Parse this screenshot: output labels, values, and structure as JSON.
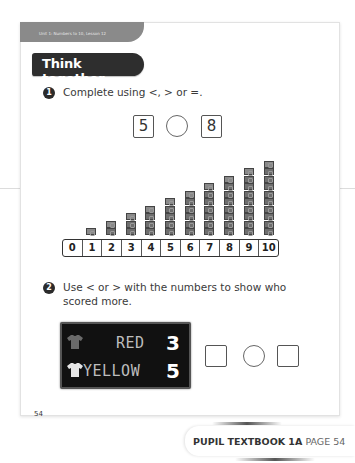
{
  "header": {
    "unit_label": "Unit 1: Numbers to 10, Lesson 12",
    "section_title": "Think together"
  },
  "question1": {
    "number": "1",
    "prompt": "Complete using <, > or =.",
    "left_value": "5",
    "right_value": "8",
    "comparison_symbol": "",
    "cube_towers": [
      1,
      2,
      3,
      4,
      5,
      6,
      7,
      8,
      9,
      10
    ],
    "number_track": [
      "0",
      "1",
      "2",
      "3",
      "4",
      "5",
      "6",
      "7",
      "8",
      "9",
      "10"
    ]
  },
  "question2": {
    "number": "2",
    "prompt_line1": "Use < or > with the numbers to show who",
    "prompt_line2": "scored more.",
    "scoreboard": [
      {
        "team": "RED",
        "score": "3",
        "shirt_color": "#6a6a6a",
        "shirt_icon": "shirt-icon"
      },
      {
        "team": "YELLOW",
        "score": "5",
        "shirt_color": "#e6e6e6",
        "shirt_icon": "shirt-icon"
      }
    ],
    "answer_left": "",
    "answer_symbol": "",
    "answer_right": ""
  },
  "footer": {
    "page_number": "54",
    "book_label": "PUPIL TEXTBOOK 1A",
    "page_label": "PAGE 54"
  },
  "colors": {
    "title_bg": "#2e2e2e",
    "unit_tab_bg": "#8a8a8a",
    "scoreboard_bg": "#111111",
    "cube": "#6e6e6e"
  }
}
